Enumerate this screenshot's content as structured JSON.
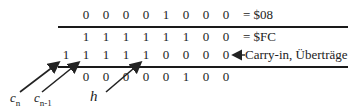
{
  "rows": [
    {
      "name": "operand-a",
      "digits": [
        "0",
        "0",
        "0",
        "0",
        "1",
        "0",
        "0",
        "0"
      ],
      "label": "= $08"
    },
    {
      "name": "operand-b",
      "digits": [
        "1",
        "1",
        "1",
        "1",
        "1",
        "1",
        "0",
        "0"
      ],
      "label": "= $FC"
    },
    {
      "name": "carries",
      "digits": [
        "1",
        "1",
        "1",
        "1",
        "1",
        "0",
        "0",
        "0",
        "0"
      ],
      "label": "Carry-in, Überträge"
    },
    {
      "name": "result",
      "digits": [
        "0",
        "0",
        "0",
        "0",
        "0",
        "1",
        "0",
        "0"
      ],
      "label": ""
    }
  ],
  "annotations": {
    "cn": {
      "base": "c",
      "sub": "n"
    },
    "cn1": {
      "base": "c",
      "sub": "n-1"
    },
    "h": {
      "base": "h"
    }
  }
}
